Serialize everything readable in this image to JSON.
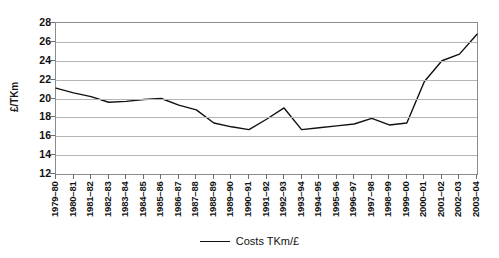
{
  "chart_data": {
    "type": "line",
    "title": "",
    "subtitle": "",
    "xlabel": "",
    "ylabel": "£/TKm",
    "ylim": [
      12,
      28
    ],
    "ytick_step": 2,
    "yticks": [
      28,
      26,
      24,
      22,
      20,
      18,
      16,
      14,
      12
    ],
    "grid": true,
    "grid_axis": "y",
    "legend_position": "bottom-center",
    "categories": [
      "1979–80",
      "1980–81",
      "1981–82",
      "1982–83",
      "1983–84",
      "1984–85",
      "1985–86",
      "1986–87",
      "1987–88",
      "1988–89",
      "1989–90",
      "1990–91",
      "1991–92",
      "1992–93",
      "1993–94",
      "1994–95",
      "1995–96",
      "1996–97",
      "1997–98",
      "1998–99",
      "1999–00",
      "2000–01",
      "2001–02",
      "2002–03",
      "2003–04"
    ],
    "series": [
      {
        "name": "Costs TKm/£",
        "color": "#111111",
        "values": [
          21.1,
          20.6,
          20.2,
          19.6,
          19.7,
          19.9,
          20.0,
          19.3,
          18.8,
          17.4,
          17.0,
          16.7,
          17.8,
          19.0,
          16.7,
          16.9,
          17.1,
          17.3,
          17.9,
          17.2,
          17.4,
          21.8,
          24.0,
          24.7,
          26.8
        ]
      }
    ]
  },
  "legend": {
    "entries": [
      {
        "label": "Costs TKm/£",
        "color": "#111111"
      }
    ]
  },
  "colors": {
    "line": "#111111",
    "grid": "#b4b4b4",
    "frame": "#8c8c8c",
    "tick": "#6e6e6e",
    "text": "#111111",
    "background": "#ffffff"
  }
}
